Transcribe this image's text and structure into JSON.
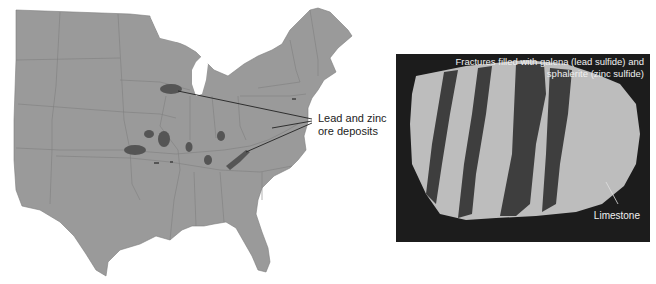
{
  "figure": {
    "map": {
      "name": "Eastern United States",
      "land_color": "#9a9a9a",
      "deposit_color": "#555555",
      "callout": {
        "line1": "Lead and zinc",
        "line2": "ore deposits"
      }
    },
    "photo": {
      "caption_line1": "Fractures filled with galena (lead sulfide) and",
      "caption_line2": "sphalerite (zinc sulfide)",
      "label": "Limestone",
      "background_color": "#1c1c1c"
    }
  }
}
